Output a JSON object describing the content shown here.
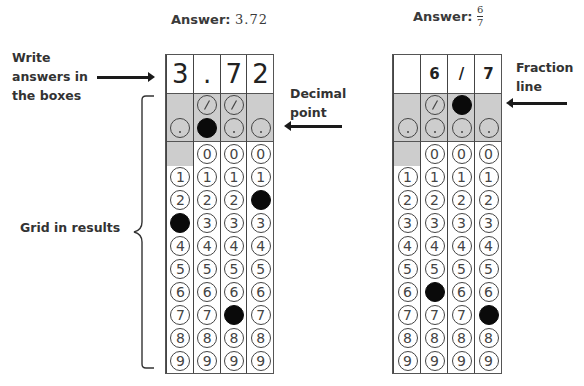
{
  "left_example": {
    "title_prefix": "Answer:",
    "title_value": "3.72",
    "write_boxes": [
      "3",
      ".",
      "7",
      "2"
    ],
    "filled": {
      "col0": "3",
      "col1": ".",
      "col2": "7",
      "col3": "2"
    }
  },
  "right_example": {
    "title_prefix": "Answer:",
    "fraction": {
      "numerator": "6",
      "denominator": "7"
    },
    "write_boxes": [
      "",
      "6",
      "/",
      "7"
    ],
    "filled": {
      "col0": null,
      "col1": "6",
      "col2": "/",
      "col3": "7"
    }
  },
  "annotations": {
    "write_answers": [
      "Write",
      "answers in",
      "the boxes"
    ],
    "decimal_point": [
      "Decimal",
      "point"
    ],
    "fraction_line": [
      "Fraction",
      "line"
    ],
    "grid_in_results": "Grid in results"
  },
  "bubble_symbols": {
    "slash": "/",
    "dot": ".",
    "digits": [
      "0",
      "1",
      "2",
      "3",
      "4",
      "5",
      "6",
      "7",
      "8",
      "9"
    ]
  },
  "colors": {
    "shade": "#cdcdcd",
    "filled_bubble": "#0a0a0a",
    "border": "#444444"
  }
}
